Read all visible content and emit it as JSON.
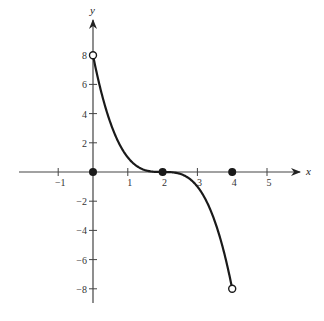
{
  "chart_data": {
    "type": "line",
    "title": "",
    "xlabel": "x",
    "ylabel": "y",
    "xlim": [
      -1.5,
      5.8
    ],
    "ylim": [
      -9,
      9
    ],
    "grid": false,
    "function": "y = -(x-2)^3",
    "domain": [
      0,
      4
    ],
    "x_ticks": [
      -1,
      1,
      2,
      3,
      4,
      5
    ],
    "x_tick_labels": [
      "-1",
      "1",
      "2",
      "3",
      "4",
      "5"
    ],
    "y_ticks": [
      8,
      6,
      4,
      2,
      -2,
      -4,
      -6,
      -8
    ],
    "y_tick_labels": [
      "8",
      "6",
      "4",
      "2",
      "-2",
      "-4",
      "-6",
      "-8"
    ],
    "series": [
      {
        "name": "f(x)",
        "x": [
          0,
          0.5,
          1,
          1.5,
          2,
          2.5,
          3,
          3.5,
          4
        ],
        "y": [
          8,
          3.375,
          1,
          0.125,
          0,
          -0.125,
          -1,
          -3.375,
          -8
        ]
      }
    ],
    "open_points": [
      [
        0,
        8
      ],
      [
        4,
        -8
      ]
    ],
    "filled_points": [
      [
        0,
        0
      ],
      [
        2,
        0
      ],
      [
        4,
        0
      ]
    ]
  },
  "axes": {
    "x_label": "x",
    "y_label": "y"
  },
  "colors": {
    "curve": "#1a1a1a",
    "axis": "#444444"
  }
}
